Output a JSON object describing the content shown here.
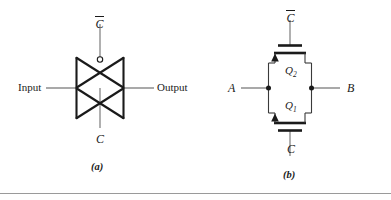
{
  "figure": {
    "page_width": 391,
    "page_height": 200,
    "background_color": "#ffffff",
    "stroke_color": "#1a1a1a",
    "rule_color": "#9a9a9a",
    "baseline_rule_y": 193,
    "panels": [
      {
        "id": "panel-a",
        "caption": "(a)",
        "caption_x": 88,
        "caption_y": 160,
        "type": "transmission-gate-symbol",
        "labels": {
          "control_top": "C",
          "control_top_overbar": true,
          "control_bottom": "C",
          "control_bottom_overbar": false,
          "input": "Input",
          "output": "Output"
        },
        "label_positions": {
          "control_top": {
            "x": 92,
            "y": 18
          },
          "control_bottom": {
            "x": 93,
            "y": 134
          },
          "input": {
            "x": 18,
            "y": 82
          },
          "output": {
            "x": 146,
            "y": 82
          }
        },
        "geometry": {
          "left_bar_x": 76,
          "right_bar_x": 124,
          "top_y": 58,
          "mid_y": 88,
          "bottom_y": 115,
          "bubble": {
            "cx": 100,
            "cy": 60.5,
            "r": 2.6
          },
          "control_top_line": {
            "x": 100,
            "y1": 24,
            "y2": 58
          },
          "control_bottom_line": {
            "x": 100,
            "y1": 88,
            "y2": 128
          },
          "input_lead": {
            "y": 88,
            "x1": 46,
            "x2": 76
          },
          "output_lead": {
            "y": 88,
            "x1": 124,
            "x2": 154
          }
        }
      },
      {
        "id": "panel-b",
        "caption": "(b)",
        "caption_x": 285,
        "caption_y": 168,
        "type": "cmos-transmission-gate-schematic",
        "labels": {
          "control_top": "C",
          "control_top_overbar": true,
          "control_bottom": "C",
          "control_bottom_overbar": false,
          "node_left": "A",
          "node_right": "B",
          "transistor_top": "Q2",
          "transistor_top_base": "Q",
          "transistor_top_sub": "2",
          "transistor_bottom": "Q1",
          "transistor_bottom_base": "Q",
          "transistor_bottom_sub": "1"
        },
        "label_positions": {
          "control_top": {
            "x": 285,
            "y": 13
          },
          "control_bottom": {
            "x": 286,
            "y": 142
          },
          "node_left": {
            "x": 228,
            "y": 81
          },
          "node_right": {
            "x": 348,
            "y": 81
          },
          "transistor_top": {
            "x": 287,
            "y": 66
          },
          "transistor_bottom": {
            "x": 287,
            "y": 101
          }
        },
        "geometry": {
          "center_x": 290,
          "left_rail_x": 268,
          "right_rail_x": 312,
          "mid_y": 88,
          "gate_top_bar": {
            "y": 46,
            "x1": 279,
            "x2": 301
          },
          "channel_top_bar": {
            "y": 52.5,
            "x1": 275,
            "x2": 305
          },
          "gate_bot_bar": {
            "y": 130,
            "x1": 279,
            "x2": 301
          },
          "channel_bot_bar": {
            "y": 123.5,
            "x1": 275,
            "x2": 305
          },
          "control_top_line": {
            "x": 290,
            "y1": 20,
            "y2": 46
          },
          "control_bottom_line": {
            "x": 290,
            "y1": 130,
            "y2": 156
          },
          "node_dot_left": {
            "cx": 268,
            "cy": 88,
            "r": 2.4
          },
          "node_dot_right": {
            "cx": 312,
            "cy": 88,
            "r": 2.4
          },
          "lead_left": {
            "y": 88,
            "x1": 241,
            "x2": 268
          },
          "lead_right": {
            "y": 88,
            "x1": 312,
            "x2": 340
          },
          "arrow_top": {
            "x": 277,
            "y": 58,
            "direction": "up"
          },
          "arrow_bottom": {
            "x": 277,
            "y": 118,
            "direction": "up"
          }
        }
      }
    ]
  }
}
